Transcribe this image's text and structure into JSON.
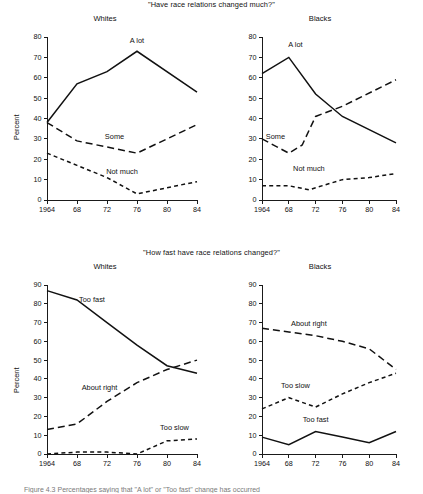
{
  "figure": {
    "caption": "Figure 4.3   Percentages saying that \"A lot\" or \"Too fast\" change has occurred"
  },
  "panels": {
    "top": {
      "question": "\"Have race relations changed much?\"",
      "left_title": "Whites",
      "right_title": "Blacks",
      "ylabel": "Percent"
    },
    "bottom": {
      "question": "\"How fast have race relations changed?\"",
      "left_title": "Whites",
      "right_title": "Blacks",
      "ylabel": "Percent"
    }
  },
  "chart_data": [
    {
      "id": "whites-changed-much",
      "type": "line",
      "title": "Whites",
      "subtitle": "\"Have race relations changed much?\"",
      "xlabel": "",
      "ylabel": "Percent",
      "xlim": [
        1964,
        1984
      ],
      "ylim": [
        0,
        80
      ],
      "yticks": [
        0,
        10,
        20,
        30,
        40,
        50,
        60,
        70,
        80
      ],
      "xticks": [
        1964,
        1968,
        1972,
        1976,
        1980,
        1984
      ],
      "xticklabels": [
        "1964",
        "68",
        "72",
        "76",
        "80",
        "84"
      ],
      "grid": false,
      "legend": "inline-annotations",
      "series": [
        {
          "name": "A lot",
          "style": "solid",
          "x": [
            1964,
            1968,
            1972,
            1976,
            1984
          ],
          "values": [
            38,
            57,
            63,
            73,
            53
          ],
          "label_x": 1976,
          "label_y": 77
        },
        {
          "name": "Some",
          "style": "longdash",
          "x": [
            1964,
            1968,
            1972,
            1976,
            1984
          ],
          "values": [
            38,
            29,
            26,
            23,
            37
          ],
          "label_x": 1973,
          "label_y": 30
        },
        {
          "name": "Not much",
          "style": "shortdash",
          "x": [
            1964,
            1968,
            1972,
            1976,
            1984
          ],
          "values": [
            23,
            17,
            11,
            3,
            9
          ],
          "label_x": 1974,
          "label_y": 13
        }
      ]
    },
    {
      "id": "blacks-changed-much",
      "type": "line",
      "title": "Blacks",
      "subtitle": "\"Have race relations changed much?\"",
      "xlabel": "",
      "ylabel": "Percent",
      "xlim": [
        1964,
        1984
      ],
      "ylim": [
        0,
        80
      ],
      "yticks": [
        0,
        10,
        20,
        30,
        40,
        50,
        60,
        70,
        80
      ],
      "xticks": [
        1964,
        1968,
        1972,
        1976,
        1980,
        1984
      ],
      "xticklabels": [
        "1964",
        "68",
        "72",
        "76",
        "80",
        "84"
      ],
      "grid": false,
      "legend": "inline-annotations",
      "series": [
        {
          "name": "A lot",
          "style": "solid",
          "x": [
            1964,
            1968,
            1972,
            1976,
            1984
          ],
          "values": [
            62,
            70,
            52,
            41,
            28
          ],
          "label_x": 1969,
          "label_y": 75
        },
        {
          "name": "Some",
          "style": "longdash",
          "x": [
            1964,
            1968,
            1970,
            1972,
            1976,
            1984
          ],
          "values": [
            30,
            23,
            27,
            41,
            46,
            59
          ],
          "label_x": 1966,
          "label_y": 30
        },
        {
          "name": "Not much",
          "style": "shortdash",
          "x": [
            1964,
            1968,
            1971,
            1976,
            1980,
            1984
          ],
          "values": [
            7,
            7,
            5,
            10,
            11,
            13
          ],
          "label_x": 1971,
          "label_y": 14
        }
      ]
    },
    {
      "id": "whites-how-fast",
      "type": "line",
      "title": "Whites",
      "subtitle": "\"How fast have race relations changed?\"",
      "xlabel": "",
      "ylabel": "Percent",
      "xlim": [
        1964,
        1984
      ],
      "ylim": [
        0,
        90
      ],
      "yticks": [
        0,
        10,
        20,
        30,
        40,
        50,
        60,
        70,
        80,
        90
      ],
      "xticks": [
        1964,
        1968,
        1972,
        1976,
        1980,
        1984
      ],
      "xticklabels": [
        "1964",
        "68",
        "72",
        "76",
        "80",
        "84"
      ],
      "grid": false,
      "legend": "inline-annotations",
      "series": [
        {
          "name": "Too fast",
          "style": "solid",
          "x": [
            1964,
            1968,
            1972,
            1976,
            1980,
            1984
          ],
          "values": [
            87,
            82,
            70,
            58,
            47,
            43
          ],
          "label_x": 1970,
          "label_y": 81
        },
        {
          "name": "About right",
          "style": "longdash",
          "x": [
            1964,
            1968,
            1972,
            1976,
            1980,
            1984
          ],
          "values": [
            13,
            16,
            28,
            38,
            45,
            50
          ],
          "label_x": 1971,
          "label_y": 34
        },
        {
          "name": "Too slow",
          "style": "shortdash",
          "x": [
            1964,
            1968,
            1972,
            1976,
            1980,
            1984
          ],
          "values": [
            0,
            1,
            1,
            0,
            7,
            8
          ],
          "label_x": 1981,
          "label_y": 13
        }
      ]
    },
    {
      "id": "blacks-how-fast",
      "type": "line",
      "title": "Blacks",
      "subtitle": "\"How fast have race relations changed?\"",
      "xlabel": "",
      "ylabel": "Percent",
      "xlim": [
        1964,
        1984
      ],
      "ylim": [
        0,
        90
      ],
      "yticks": [
        0,
        10,
        20,
        30,
        40,
        50,
        60,
        70,
        80,
        90
      ],
      "xticks": [
        1964,
        1968,
        1972,
        1976,
        1980,
        1984
      ],
      "xticklabels": [
        "1964",
        "68",
        "72",
        "76",
        "80",
        "84"
      ],
      "grid": false,
      "legend": "inline-annotations",
      "series": [
        {
          "name": "About right",
          "style": "longdash",
          "x": [
            1964,
            1968,
            1972,
            1976,
            1980,
            1984
          ],
          "values": [
            67,
            65,
            63,
            60,
            56,
            45
          ],
          "label_x": 1971,
          "label_y": 68
        },
        {
          "name": "Too slow",
          "style": "shortdash",
          "x": [
            1964,
            1968,
            1972,
            1976,
            1980,
            1984
          ],
          "values": [
            24,
            30,
            25,
            32,
            38,
            43
          ],
          "label_x": 1969,
          "label_y": 35
        },
        {
          "name": "Too fast",
          "style": "solid",
          "x": [
            1964,
            1968,
            1972,
            1976,
            1980,
            1984
          ],
          "values": [
            9,
            5,
            12,
            9,
            6,
            12
          ],
          "label_x": 1972,
          "label_y": 17
        }
      ]
    }
  ]
}
